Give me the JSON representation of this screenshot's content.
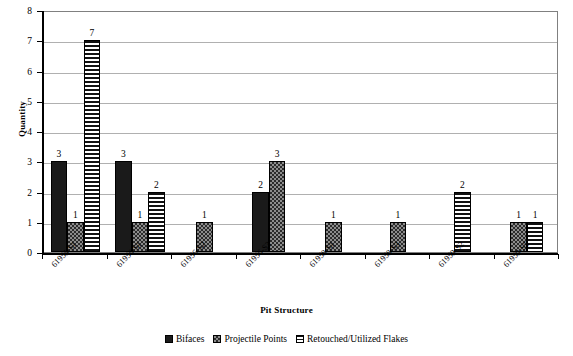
{
  "chart_data": {
    "type": "bar",
    "title": "",
    "xlabel": "Pit Structure",
    "ylabel": "Quantity",
    "ylim": [
      0,
      8
    ],
    "yticks": [
      "0",
      "1",
      "2",
      "3",
      "4",
      "5",
      "6",
      "7",
      "8"
    ],
    "grid": true,
    "legend_position": "bottom",
    "categories": [
      "61955-S1",
      "61956-S1",
      "61956-S2",
      "61956-S3",
      "61958-S1",
      "61958-S3",
      "61959-S2",
      "61959-S5"
    ],
    "series": [
      {
        "name": "Bifaces",
        "pattern": "solid-black",
        "color": "#1a1a1a",
        "values": [
          3,
          3,
          0,
          2,
          0,
          0,
          0,
          0
        ],
        "labels": [
          "3",
          "3",
          "",
          "2",
          "",
          "",
          "",
          ""
        ]
      },
      {
        "name": "Projectile Points",
        "pattern": "checkered",
        "color": "#8c8c8c",
        "values": [
          1,
          1,
          1,
          3,
          1,
          1,
          0,
          1
        ],
        "labels": [
          "1",
          "1",
          "1",
          "3",
          "1",
          "1",
          "",
          "1"
        ]
      },
      {
        "name": "Retouched/Utilized Flakes",
        "pattern": "horizontal-stripes",
        "color": "#111111",
        "values": [
          7,
          2,
          0,
          0,
          0,
          0,
          2,
          1
        ],
        "labels": [
          "7",
          "2",
          "",
          "",
          "",
          "",
          "2",
          "1"
        ]
      }
    ]
  }
}
